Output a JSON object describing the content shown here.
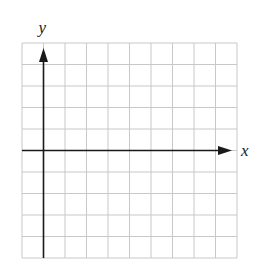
{
  "diagram": {
    "type": "coordinate-grid",
    "grid": {
      "columns": 10,
      "rows": 10,
      "left": 22,
      "top": 43,
      "cell": 21.5,
      "line_color": "#c8c8c8"
    },
    "axes": {
      "x_label": "x",
      "y_label": "y",
      "origin_col": 1,
      "origin_row": 5,
      "axis_color": "#1a1a1a"
    }
  }
}
